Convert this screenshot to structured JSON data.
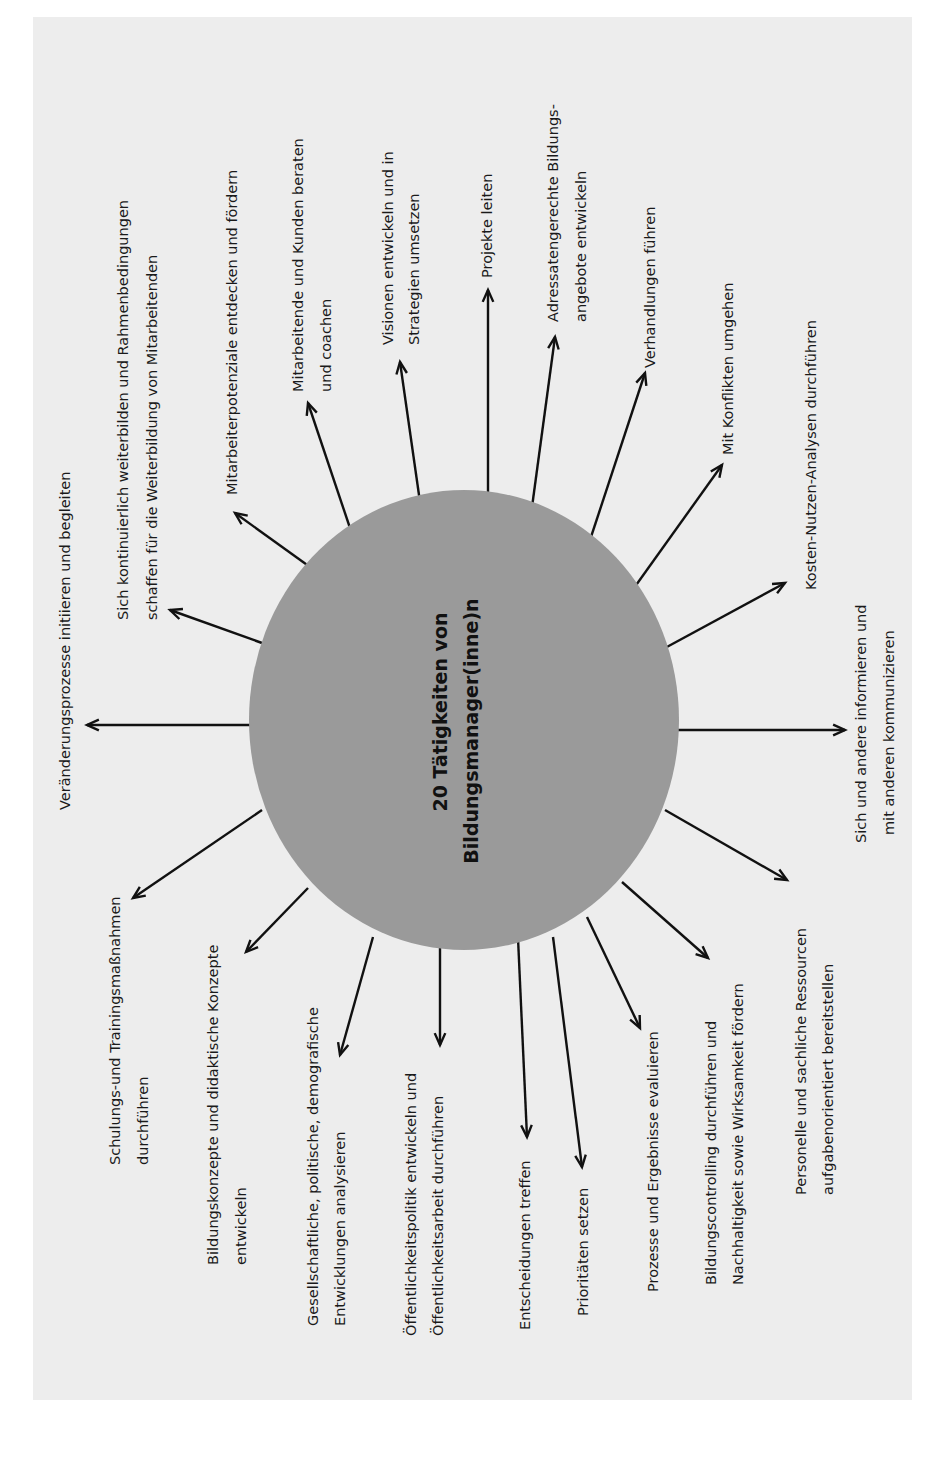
{
  "diagram": {
    "type": "radial-mindmap",
    "orientation": "rotated-90-ccw",
    "colors": {
      "background": "#ededed",
      "hub": "#9a9a9a",
      "arrows": "#111111",
      "text": "#1a1a1a"
    },
    "hub": {
      "line1": "20 Tätigkeiten von",
      "line2": "Bildungsmanager(inne)n"
    },
    "activities": [
      {
        "id": 1,
        "lines": [
          "Veränderungsprozesse initiieren und begleiten"
        ]
      },
      {
        "id": 2,
        "lines": [
          "Sich kontinuierlich weiterbilden und Rahmenbedingungen",
          "schaffen für die Weiterbildung von Mitarbeitenden"
        ]
      },
      {
        "id": 3,
        "lines": [
          "Mitarbeiterpotenziale entdecken und fördern"
        ]
      },
      {
        "id": 4,
        "lines": [
          "Mitarbeitende und Kunden beraten",
          "und coachen"
        ]
      },
      {
        "id": 5,
        "lines": [
          "Visionen entwickeln und in",
          "Strategien umsetzen"
        ]
      },
      {
        "id": 6,
        "lines": [
          "Projekte leiten"
        ]
      },
      {
        "id": 7,
        "lines": [
          "Adressatengerechte Bildungs-",
          "angebote entwickeln"
        ]
      },
      {
        "id": 8,
        "lines": [
          "Verhandlungen führen"
        ]
      },
      {
        "id": 9,
        "lines": [
          "Mit Konflikten umgehen"
        ]
      },
      {
        "id": 10,
        "lines": [
          "Kosten-Nutzen-Analysen durchführen"
        ]
      },
      {
        "id": 11,
        "lines": [
          "Sich und andere informieren und",
          "mit anderen kommunizieren"
        ]
      },
      {
        "id": 12,
        "lines": [
          "Personelle und sachliche Ressourcen",
          "aufgabenorientiert bereitstellen"
        ]
      },
      {
        "id": 13,
        "lines": [
          "Bildungscontrolling durchführen und",
          "Nachhaltigkeit sowie Wirksamkeit fördern"
        ]
      },
      {
        "id": 14,
        "lines": [
          "Prozesse und Ergebnisse evaluieren"
        ]
      },
      {
        "id": 15,
        "lines": [
          "Prioritäten setzen"
        ]
      },
      {
        "id": 16,
        "lines": [
          "Entscheidungen treffen"
        ]
      },
      {
        "id": 17,
        "lines": [
          "Öffentlichkeitspolitik entwickeln und",
          "Öffentlichkeitsarbeit durchführen"
        ]
      },
      {
        "id": 18,
        "lines": [
          "Gesellschaftliche, politische, demografische",
          "Entwicklungen analysieren"
        ]
      },
      {
        "id": 19,
        "lines": [
          "Bildungskonzepte und didaktische Konzepte",
          "entwickeln"
        ]
      },
      {
        "id": 20,
        "lines": [
          "Schulungs-und Trainingsmaßnahmen",
          "durchführen"
        ]
      }
    ]
  }
}
